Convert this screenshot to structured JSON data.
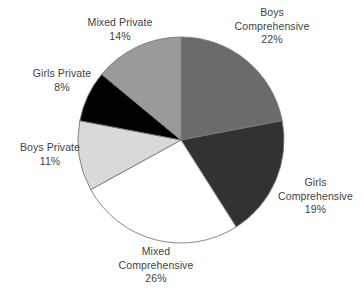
{
  "chart_data": {
    "type": "pie",
    "title": "",
    "categories": [
      "Boys Comprehensive",
      "Girls Comprehensive",
      "Mixed Comprehensive",
      "Boys Private",
      "Girls Private",
      "Mixed Private"
    ],
    "values": [
      22,
      19,
      26,
      11,
      8,
      14
    ],
    "unit": "%",
    "start_angle_deg": 0,
    "direction": "clockwise",
    "legend": "labels-outside",
    "slices": [
      {
        "name": "Boys Comprehensive",
        "label_line1": "Boys",
        "label_line2": "Comprehensive",
        "value": 22,
        "value_label": "22%",
        "color": "#6b6b6b",
        "start_deg": 0,
        "end_deg": 79.2
      },
      {
        "name": "Girls Comprehensive",
        "label_line1": "Girls",
        "label_line2": "Comprehensive",
        "value": 19,
        "value_label": "19%",
        "color": "#323232",
        "start_deg": 79.2,
        "end_deg": 147.6
      },
      {
        "name": "Mixed Comprehensive",
        "label_line1": "Mixed",
        "label_line2": "Comprehensive",
        "value": 26,
        "value_label": "26%",
        "color": "#ffffff",
        "start_deg": 147.6,
        "end_deg": 241.2
      },
      {
        "name": "Boys Private",
        "label_line1": "Boys Private",
        "label_line2": "",
        "value": 11,
        "value_label": "11%",
        "color": "#d9d9d9",
        "start_deg": 241.2,
        "end_deg": 280.8
      },
      {
        "name": "Girls Private",
        "label_line1": "Girls Private",
        "label_line2": "",
        "value": 8,
        "value_label": "8%",
        "color": "#000000",
        "start_deg": 280.8,
        "end_deg": 309.6
      },
      {
        "name": "Mixed Private",
        "label_line1": "Mixed Private",
        "label_line2": "",
        "value": 14,
        "value_label": "14%",
        "color": "#9a9a9a",
        "start_deg": 309.6,
        "end_deg": 360
      }
    ],
    "geometry": {
      "center_x": 181,
      "center_y": 140,
      "radius": 103
    },
    "stroke_color": "#7a7a7a",
    "text_color": "#3f3f3f",
    "background": "#ffffff"
  }
}
